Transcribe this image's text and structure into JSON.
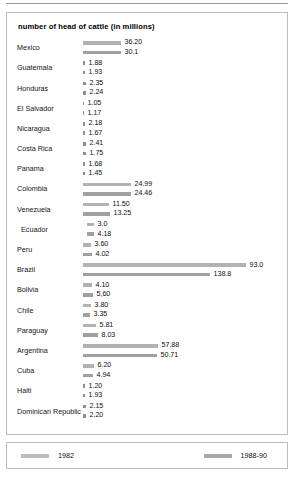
{
  "chart_data": {
    "type": "bar",
    "title": "number of head of cattle (in millions)",
    "xlabel": "",
    "ylabel": "",
    "orientation": "horizontal",
    "grid": false,
    "legend_position": "bottom",
    "categories": [
      "Mexico",
      "Guatemala",
      "Honduras",
      "El Salvador",
      "Nicaragua",
      "Costa Rica",
      "Panama",
      "Colombia",
      "Venezuela",
      "Ecuador",
      "Peru",
      "Brazil",
      "Bolivia",
      "Chile",
      "Paraguay",
      "Argentina",
      "Cuba",
      "Haiti",
      "Dominican Republic"
    ],
    "series": [
      {
        "name": "1982",
        "color": "#b2b2b2",
        "values": [
          36.2,
          1.88,
          2.35,
          1.05,
          2.18,
          2.41,
          1.68,
          24.99,
          11.5,
          3.0,
          3.6,
          93.0,
          4.1,
          3.8,
          5.81,
          57.88,
          6.2,
          1.2,
          2.15
        ],
        "labels": [
          "36.20",
          "1.88",
          "2.35",
          "1.05",
          "2.18",
          "2.41",
          "1.68",
          "24.99",
          "11.50",
          "3.0",
          "3.60",
          "93.0",
          "4.10",
          "3.80",
          "5.81",
          "57.88",
          "6.20",
          "1.20",
          "2.15"
        ],
        "bar_px": [
          38,
          2,
          3,
          1,
          2,
          3,
          2,
          48,
          26,
          7,
          8,
          163,
          9,
          8,
          13,
          75,
          11,
          2,
          3
        ]
      },
      {
        "name": "1988-90",
        "color": "#a0a0a0",
        "values": [
          30.1,
          1.93,
          2.24,
          1.17,
          1.67,
          1.75,
          1.45,
          24.46,
          13.25,
          4.18,
          4.02,
          138.8,
          5.6,
          3.35,
          8.03,
          50.71,
          4.94,
          1.93,
          2.2
        ],
        "labels": [
          "30.1",
          "1.93",
          "2.24",
          "1.17",
          "1.67",
          "1.75",
          "1.45",
          "24.46",
          "13.25",
          "4.18",
          "4.02",
          "138.8",
          "5,60",
          "3.35",
          "8.03",
          "50.71",
          "4.94",
          "1.93",
          "2.20"
        ],
        "bar_px": [
          38,
          2,
          3,
          1,
          2,
          3,
          2,
          48,
          27,
          7,
          9,
          127,
          10,
          7,
          15,
          74,
          10,
          2,
          3
        ]
      }
    ]
  },
  "legend": {
    "items": [
      {
        "label": "1982"
      },
      {
        "label": "1988-90"
      }
    ]
  }
}
